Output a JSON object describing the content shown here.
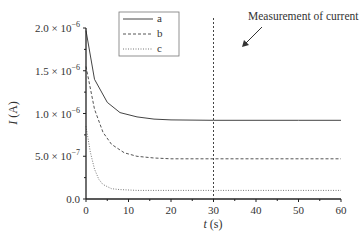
{
  "chart_data": {
    "type": "line",
    "title": "",
    "xlabel": "t (s)",
    "ylabel": "I (A)",
    "xlim": [
      0,
      60
    ],
    "ylim": [
      0,
      2e-06
    ],
    "x_ticks": [
      0,
      10,
      20,
      30,
      40,
      50,
      60
    ],
    "x_tick_labels": [
      "0",
      "10",
      "20",
      "30",
      "40",
      "50",
      "60"
    ],
    "y_ticks": [
      0,
      5e-07,
      1e-06,
      1.5e-06,
      2e-06
    ],
    "y_tick_labels": [
      {
        "mant": "0.0",
        "exp": ""
      },
      {
        "mant": "5.0 × 10",
        "exp": "−7"
      },
      {
        "mant": "1.0 × 10",
        "exp": "−6"
      },
      {
        "mant": "1.5 × 10",
        "exp": "−6"
      },
      {
        "mant": "2.0 × 10",
        "exp": "−6"
      }
    ],
    "grid": false,
    "legend_position": "upper-left-inside",
    "series": [
      {
        "name": "a",
        "style": "solid",
        "x": [
          0,
          2,
          5,
          8,
          12,
          16,
          20,
          30,
          40,
          50,
          60
        ],
        "values": [
          1.97e-06,
          1.4e-06,
          1.13e-06,
          1.01e-06,
          9.6e-07,
          9.35e-07,
          9.25e-07,
          9.2e-07,
          9.2e-07,
          9.2e-07,
          9.2e-07
        ]
      },
      {
        "name": "b",
        "style": "dashed",
        "x": [
          0,
          2,
          4,
          6,
          9,
          12,
          16,
          20,
          30,
          40,
          50,
          60
        ],
        "values": [
          1.55e-06,
          1.05e-06,
          7.8e-07,
          6.4e-07,
          5.4e-07,
          5e-07,
          4.8e-07,
          4.7e-07,
          4.7e-07,
          4.7e-07,
          4.7e-07,
          4.7e-07
        ]
      },
      {
        "name": "c",
        "style": "dotted",
        "x": [
          0,
          1,
          2,
          3,
          4,
          6,
          8,
          12,
          20,
          30,
          40,
          50,
          60
        ],
        "values": [
          8.5e-07,
          5.5e-07,
          3.5e-07,
          2.3e-07,
          1.7e-07,
          1.2e-07,
          1.1e-07,
          1e-07,
          1e-07,
          1e-07,
          1e-07,
          1e-07,
          1e-07
        ]
      }
    ],
    "annotations": [
      {
        "text": "Measurement of current",
        "type": "vertical-line",
        "x": 30,
        "style": "dotted",
        "arrow": true
      }
    ]
  },
  "labels": {
    "x_axis_italic": "t",
    "x_axis_unit": " (s)",
    "y_axis_italic": "I",
    "y_axis_unit": " (A)",
    "annotation": "Measurement of current"
  }
}
